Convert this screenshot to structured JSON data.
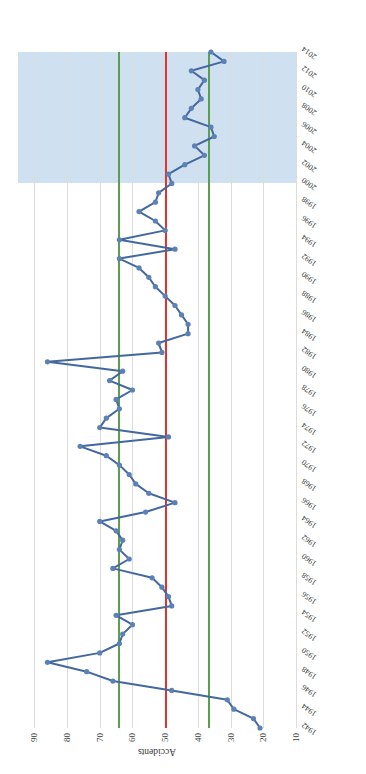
{
  "chart_data": {
    "type": "line",
    "title": "",
    "xlabel": "",
    "ylabel": "Accidents",
    "ylim": [
      10,
      95
    ],
    "xlim": [
      1942,
      2014
    ],
    "grid": true,
    "legend": "none",
    "orientation": "rotated-90-ccw",
    "ytick_labels": [
      "90",
      "80",
      "70",
      "60",
      "50",
      "40",
      "30",
      "20",
      "10"
    ],
    "ytick_values": [
      90,
      80,
      70,
      60,
      50,
      40,
      30,
      20,
      10
    ],
    "xtick_labels": [
      "1942",
      "1944",
      "1946",
      "1948",
      "1950",
      "1952",
      "1954",
      "1956",
      "1958",
      "1960",
      "1962",
      "1964",
      "1966",
      "1968",
      "1970",
      "1972",
      "1974",
      "1976",
      "1978",
      "1980",
      "1982",
      "1984",
      "1986",
      "1988",
      "1990",
      "1992",
      "1994",
      "1996",
      "1998",
      "2000",
      "2002",
      "2004",
      "2006",
      "2008",
      "2010",
      "2012",
      "2014"
    ],
    "x": [
      1942,
      1943,
      1944,
      1945,
      1946,
      1947,
      1948,
      1949,
      1950,
      1951,
      1952,
      1953,
      1954,
      1955,
      1956,
      1957,
      1958,
      1959,
      1960,
      1961,
      1962,
      1963,
      1964,
      1965,
      1966,
      1967,
      1968,
      1969,
      1970,
      1971,
      1972,
      1973,
      1974,
      1975,
      1976,
      1977,
      1978,
      1979,
      1980,
      1981,
      1982,
      1983,
      1984,
      1985,
      1986,
      1987,
      1988,
      1989,
      1990,
      1991,
      1992,
      1993,
      1994,
      1995,
      1996,
      1997,
      1998,
      1999,
      2000,
      2001,
      2002,
      2003,
      2004,
      2005,
      2006,
      2007,
      2008,
      2009,
      2010,
      2011,
      2012,
      2013,
      2014
    ],
    "values": [
      21,
      23,
      29,
      31,
      48,
      66,
      74,
      86,
      70,
      64,
      63,
      60,
      65,
      48,
      49,
      51,
      54,
      66,
      61,
      64,
      63,
      65,
      70,
      56,
      47,
      55,
      59,
      61,
      64,
      68,
      76,
      49,
      70,
      68,
      64,
      65,
      60,
      67,
      63,
      86,
      51,
      52,
      43,
      43,
      45,
      47,
      50,
      53,
      55,
      58,
      64,
      47,
      64,
      50,
      53,
      58,
      53,
      52,
      48,
      49,
      44,
      38,
      41,
      35,
      36,
      44,
      42,
      39,
      40,
      38,
      42,
      32,
      36
    ],
    "annotations": {
      "shaded_band": {
        "from": 2000,
        "to": 2014,
        "color": "#c7dced",
        "label": ""
      },
      "reference_lines": [
        {
          "value": 50,
          "color": "#e8312a"
        },
        {
          "value": 64.5,
          "color": "#5a9e4e"
        },
        {
          "value": 37,
          "color": "#5a9e4e"
        }
      ]
    },
    "colors": {
      "series_line": "#42689f",
      "series_marker": "#5b81b5",
      "gridline": "#dcdcdc",
      "band": "#c7dced",
      "ref_red": "#e8312a",
      "ref_green": "#5a9e4e",
      "background": "#ffffff"
    }
  }
}
